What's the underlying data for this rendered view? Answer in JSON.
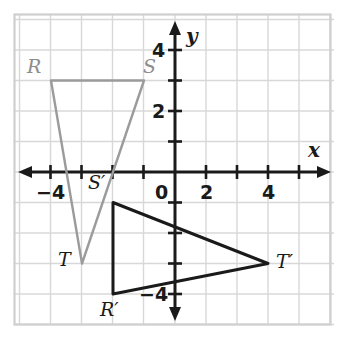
{
  "figure": {
    "type": "coordinate-plane-diagram"
  },
  "axes": {
    "x_label": "x",
    "y_label": "y",
    "origin_label": "0",
    "x_ticks": [
      {
        "value": -4,
        "label": "−4"
      },
      {
        "value": -3,
        "label": ""
      },
      {
        "value": -2,
        "label": ""
      },
      {
        "value": -1,
        "label": ""
      },
      {
        "value": 1,
        "label": ""
      },
      {
        "value": 2,
        "label": "2"
      },
      {
        "value": 3,
        "label": ""
      },
      {
        "value": 4,
        "label": "4"
      }
    ],
    "y_ticks": [
      {
        "value": 4,
        "label": "4"
      },
      {
        "value": 3,
        "label": ""
      },
      {
        "value": 2,
        "label": "2"
      },
      {
        "value": 1,
        "label": ""
      },
      {
        "value": -1,
        "label": ""
      },
      {
        "value": -2,
        "label": ""
      },
      {
        "value": -3,
        "label": ""
      },
      {
        "value": -4,
        "label": "−4"
      }
    ],
    "x_range": [
      -4.4,
      5.0
    ],
    "y_range": [
      -4.9,
      4.8
    ],
    "grid": true,
    "axis_color": "#1a1a1a",
    "grid_color": "#d8d8d8"
  },
  "shapes": [
    {
      "name": "triangle-rst",
      "style": "preimage",
      "color": "#9b9b9b",
      "vertices": [
        {
          "label": "R",
          "x": -4,
          "y": 3
        },
        {
          "label": "S",
          "x": -1,
          "y": 3
        },
        {
          "label": "T",
          "x": -3,
          "y": -3
        }
      ]
    },
    {
      "name": "triangle-rst-prime",
      "style": "image",
      "color": "#1a1a1a",
      "vertices": [
        {
          "label": "S′",
          "x": -2,
          "y": -1
        },
        {
          "label": "T′",
          "x": 3,
          "y": -3
        },
        {
          "label": "R′",
          "x": -2,
          "y": -4
        }
      ]
    }
  ],
  "vertex_labels": [
    {
      "text": "R",
      "kind": "pre",
      "left": 27,
      "top": 57
    },
    {
      "text": "S",
      "kind": "pre",
      "left": 143,
      "top": 57
    },
    {
      "text": "T",
      "kind": "img",
      "left": 58,
      "top": 250
    },
    {
      "text": "S′",
      "kind": "img",
      "left": 88,
      "top": 173
    },
    {
      "text": "R′",
      "kind": "img",
      "left": 100,
      "top": 300
    },
    {
      "text": "T′",
      "kind": "img",
      "left": 276,
      "top": 252
    }
  ],
  "chart_data": {
    "type": "scatter",
    "title": "",
    "xlabel": "x",
    "ylabel": "y",
    "xlim": [
      -4.4,
      5.0
    ],
    "ylim": [
      -4.9,
      4.8
    ],
    "grid": true,
    "series": [
      {
        "name": "Triangle RST",
        "color": "#9b9b9b",
        "closed": true,
        "points": [
          {
            "label": "R",
            "x": -4,
            "y": 3
          },
          {
            "label": "S",
            "x": -1,
            "y": 3
          },
          {
            "label": "T",
            "x": -3,
            "y": -3
          }
        ]
      },
      {
        "name": "Triangle R'S'T'",
        "color": "#1a1a1a",
        "closed": true,
        "points": [
          {
            "label": "S'",
            "x": -2,
            "y": -1
          },
          {
            "label": "T'",
            "x": 3,
            "y": -3
          },
          {
            "label": "R'",
            "x": -2,
            "y": -4
          }
        ]
      }
    ]
  }
}
